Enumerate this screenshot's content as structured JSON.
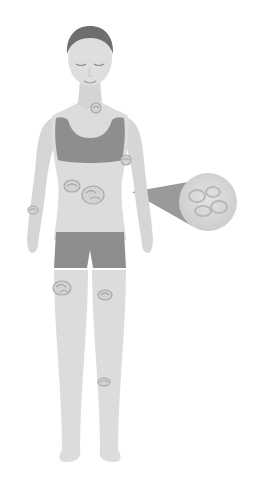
{
  "illustration": {
    "description": "Grayscale illustration of a standing woman in sports bra and shorts with circular skin lesions marked on the body and a magnified callout of one lesion",
    "colors": {
      "background": "#ffffff",
      "skin": "#dcdcdc",
      "skin_shade": "#cfcfcf",
      "clothing": "#8e8e8e",
      "hair": "#6e6e6e",
      "lesion_fill": "#d2d2d2",
      "lesion_stroke": "#a8a8a8",
      "callout_pointer": "#9a9a9a",
      "callout_circle": "#dadada"
    },
    "lesions": [
      {
        "location": "neck",
        "cx": 96,
        "cy": 108,
        "r": 5
      },
      {
        "location": "right-upper-arm",
        "cx": 126,
        "cy": 160,
        "r": 5
      },
      {
        "location": "left-abdomen",
        "cx": 72,
        "cy": 186,
        "r": 7
      },
      {
        "location": "center-abdomen",
        "cx": 93,
        "cy": 195,
        "r": 10
      },
      {
        "location": "left-forearm",
        "cx": 33,
        "cy": 210,
        "r": 5
      },
      {
        "location": "left-thigh",
        "cx": 62,
        "cy": 288,
        "r": 8
      },
      {
        "location": "right-thigh",
        "cx": 105,
        "cy": 295,
        "r": 6
      },
      {
        "location": "right-shin",
        "cx": 104,
        "cy": 382,
        "r": 6
      }
    ],
    "callout": {
      "pointer_tip": {
        "x": 132,
        "y": 192
      },
      "circle": {
        "cx": 208,
        "cy": 202,
        "r": 29
      }
    }
  }
}
